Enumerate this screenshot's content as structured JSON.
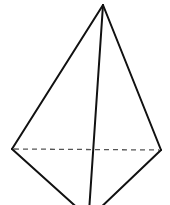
{
  "diagram": {
    "type": "tetrahedron-sketch",
    "vertices": {
      "apex": [
        103,
        5
      ],
      "left": [
        12,
        149
      ],
      "right": [
        161,
        150
      ],
      "bottom": [
        90,
        212
      ]
    },
    "edges": [
      {
        "from": "apex",
        "to": "left",
        "style": "solid"
      },
      {
        "from": "apex",
        "to": "right",
        "style": "solid"
      },
      {
        "from": "apex",
        "to": "bottom",
        "style": "solid"
      },
      {
        "from": "left",
        "to": "bottom",
        "style": "solid"
      },
      {
        "from": "right",
        "to": "bottom",
        "style": "solid"
      },
      {
        "from": "left",
        "to": "right",
        "style": "dashed"
      }
    ],
    "colors": {
      "stroke": "#111111",
      "dashed": "#555555",
      "background": "#ffffff"
    }
  }
}
